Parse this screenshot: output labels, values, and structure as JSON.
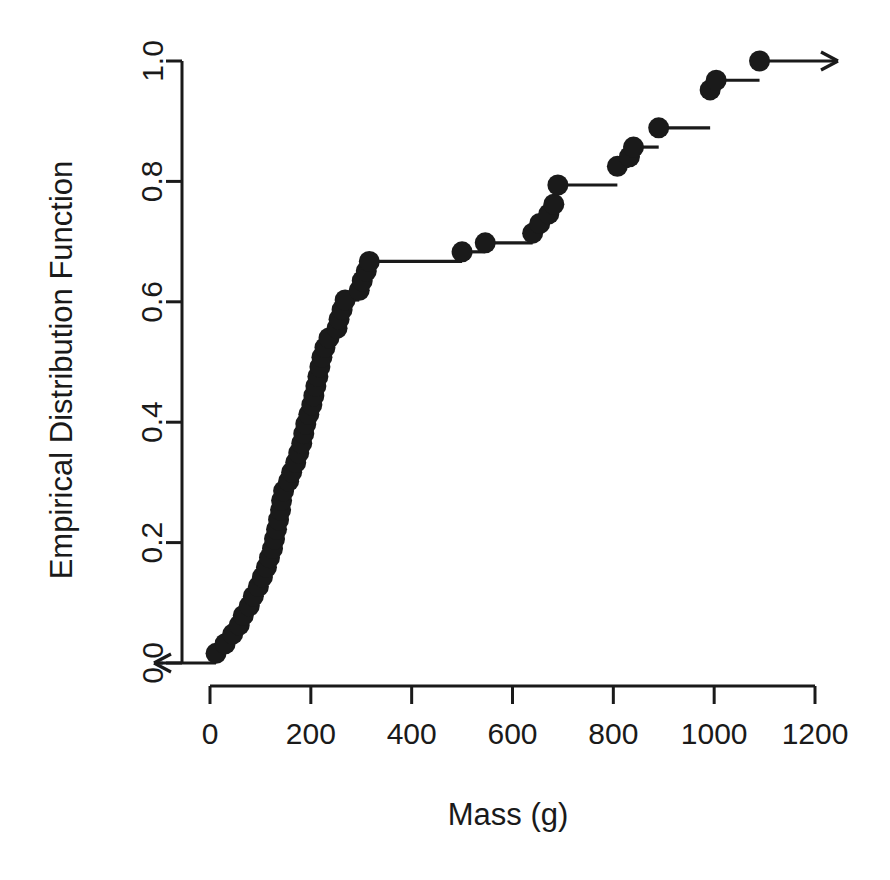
{
  "chart_data": {
    "type": "line",
    "subtype": "empirical-cumulative-distribution-function-step",
    "title": "",
    "subtitle": "",
    "xlabel": "Mass (g)",
    "ylabel": "Empirical Distribution Function",
    "xlim": [
      0,
      1200
    ],
    "ylim": [
      0.0,
      1.0
    ],
    "xticks": [
      0,
      200,
      400,
      600,
      800,
      1000,
      1200
    ],
    "xtick_labels": [
      "0",
      "200",
      "400",
      "600",
      "800",
      "1000",
      "1200"
    ],
    "yticks": [
      0.0,
      0.2,
      0.4,
      0.6,
      0.8,
      1.0
    ],
    "ytick_labels": [
      "0.0",
      "0.2",
      "0.4",
      "0.6",
      "0.8",
      "1.0"
    ],
    "grid": false,
    "legend": null,
    "legend_position": "none",
    "marker": "filled-circle",
    "marker_color": "#1a1a1a",
    "line_color": "#1a1a1a",
    "left_arrow": true,
    "right_arrow": true,
    "n_points": 63,
    "annotations": [
      "Left-pointing arrow at y = 0.0 extending from first point toward lower mass",
      "Right-pointing arrow at y = 1.0 extending from last point toward higher mass"
    ],
    "x": [
      12,
      22,
      32,
      42,
      52,
      60,
      68,
      76,
      84,
      92,
      100,
      106,
      112,
      118,
      124,
      130,
      134,
      138,
      142,
      146,
      152,
      158,
      164,
      170,
      176,
      182,
      188,
      194,
      200,
      206,
      212,
      218,
      224,
      230,
      236,
      242,
      248,
      254,
      260,
      266,
      272,
      278,
      284,
      296,
      306,
      312,
      500,
      512,
      546,
      640,
      654,
      666,
      676,
      684,
      690,
      694,
      700,
      808,
      826,
      838,
      846,
      890,
      996,
      1004,
      1090
    ],
    "y": [
      0.016,
      0.032,
      0.048,
      0.063,
      0.079,
      0.095,
      0.111,
      0.127,
      0.143,
      0.159,
      0.175,
      0.19,
      0.206,
      0.222,
      0.238,
      0.254,
      0.27,
      0.286,
      0.302,
      0.317,
      0.333,
      0.349,
      0.365,
      0.381,
      0.397,
      0.413,
      0.429,
      0.444,
      0.46,
      0.476,
      0.492,
      0.508,
      0.524,
      0.54,
      0.556,
      0.571,
      0.587,
      0.603,
      0.619,
      0.635,
      0.651,
      0.667,
      0.683,
      0.698,
      0.714,
      0.73,
      0.746,
      0.762,
      0.778,
      0.794,
      0.81,
      0.825,
      0.841,
      0.857,
      0.873,
      0.889,
      0.905,
      0.921,
      0.937,
      0.952,
      0.968,
      0.984,
      1.0
    ],
    "points": [
      {
        "x": 12,
        "y": 0.016
      },
      {
        "x": 30,
        "y": 0.032
      },
      {
        "x": 45,
        "y": 0.048
      },
      {
        "x": 58,
        "y": 0.063
      },
      {
        "x": 66,
        "y": 0.079
      },
      {
        "x": 78,
        "y": 0.095
      },
      {
        "x": 86,
        "y": 0.111
      },
      {
        "x": 96,
        "y": 0.127
      },
      {
        "x": 104,
        "y": 0.143
      },
      {
        "x": 112,
        "y": 0.159
      },
      {
        "x": 118,
        "y": 0.175
      },
      {
        "x": 124,
        "y": 0.19
      },
      {
        "x": 128,
        "y": 0.206
      },
      {
        "x": 132,
        "y": 0.222
      },
      {
        "x": 136,
        "y": 0.238
      },
      {
        "x": 140,
        "y": 0.254
      },
      {
        "x": 142,
        "y": 0.27
      },
      {
        "x": 146,
        "y": 0.286
      },
      {
        "x": 156,
        "y": 0.302
      },
      {
        "x": 162,
        "y": 0.317
      },
      {
        "x": 170,
        "y": 0.333
      },
      {
        "x": 176,
        "y": 0.349
      },
      {
        "x": 182,
        "y": 0.365
      },
      {
        "x": 186,
        "y": 0.381
      },
      {
        "x": 190,
        "y": 0.397
      },
      {
        "x": 196,
        "y": 0.413
      },
      {
        "x": 202,
        "y": 0.429
      },
      {
        "x": 206,
        "y": 0.444
      },
      {
        "x": 210,
        "y": 0.46
      },
      {
        "x": 214,
        "y": 0.476
      },
      {
        "x": 218,
        "y": 0.492
      },
      {
        "x": 222,
        "y": 0.508
      },
      {
        "x": 228,
        "y": 0.524
      },
      {
        "x": 236,
        "y": 0.54
      },
      {
        "x": 252,
        "y": 0.556
      },
      {
        "x": 256,
        "y": 0.571
      },
      {
        "x": 262,
        "y": 0.587
      },
      {
        "x": 268,
        "y": 0.603
      },
      {
        "x": 296,
        "y": 0.619
      },
      {
        "x": 302,
        "y": 0.635
      },
      {
        "x": 310,
        "y": 0.651
      },
      {
        "x": 316,
        "y": 0.667
      },
      {
        "x": 500,
        "y": 0.683
      },
      {
        "x": 546,
        "y": 0.698
      },
      {
        "x": 640,
        "y": 0.714
      },
      {
        "x": 654,
        "y": 0.73
      },
      {
        "x": 672,
        "y": 0.746
      },
      {
        "x": 682,
        "y": 0.762
      },
      {
        "x": 690,
        "y": 0.794
      },
      {
        "x": 808,
        "y": 0.825
      },
      {
        "x": 832,
        "y": 0.841
      },
      {
        "x": 840,
        "y": 0.857
      },
      {
        "x": 890,
        "y": 0.889
      },
      {
        "x": 992,
        "y": 0.952
      },
      {
        "x": 1004,
        "y": 0.968
      },
      {
        "x": 1090,
        "y": 1.0
      }
    ]
  },
  "axes": {
    "x_title": "Mass (g)",
    "y_title": "Empirical Distribution Function",
    "x_tick_labels": [
      "0",
      "200",
      "400",
      "600",
      "800",
      "1000",
      "1200"
    ],
    "y_tick_labels": [
      "0.0",
      "0.2",
      "0.4",
      "0.6",
      "0.8",
      "1.0"
    ]
  },
  "style": {
    "foreground": "#1a1a1a",
    "background": "#ffffff"
  }
}
